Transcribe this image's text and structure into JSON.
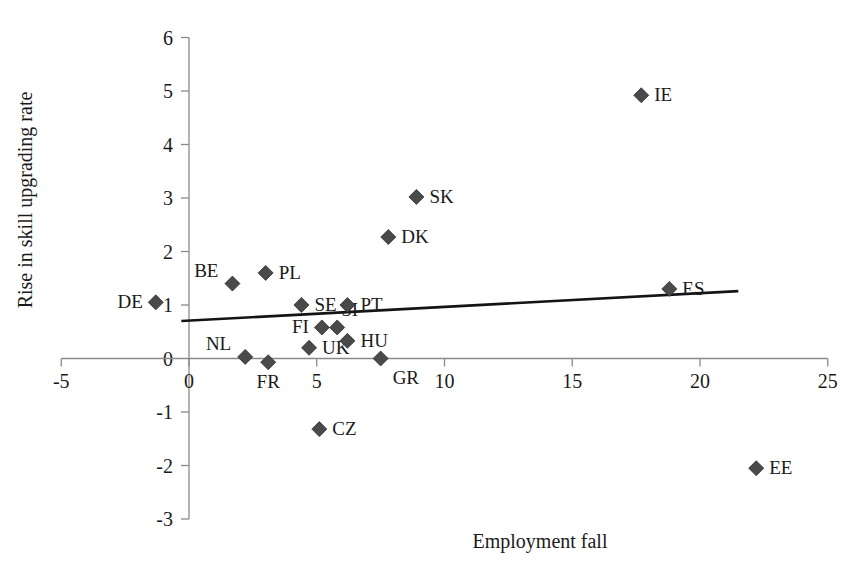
{
  "chart_data": {
    "type": "scatter",
    "title": "",
    "xlabel": "Employment fall",
    "ylabel": "Rise in skill upgrading rate",
    "xlim": [
      -5,
      25
    ],
    "ylim": [
      -3,
      6
    ],
    "xticks": [
      -5,
      0,
      5,
      10,
      15,
      20,
      25
    ],
    "yticks": [
      -3,
      -2,
      -1,
      0,
      1,
      2,
      3,
      4,
      5,
      6
    ],
    "xtick_labels": [
      "-5",
      "0",
      "5",
      "10",
      "15",
      "20",
      "25"
    ],
    "ytick_labels": [
      "-3",
      "-2",
      "-1",
      "0",
      "1",
      "2",
      "3",
      "4",
      "5",
      "6"
    ],
    "grid": false,
    "legend": "none",
    "marker_shape": "diamond",
    "marker_color": "#4a4a4a",
    "points": [
      {
        "label": "DE",
        "x": -1.3,
        "y": 1.05,
        "label_side": "left"
      },
      {
        "label": "BE",
        "x": 1.7,
        "y": 1.4,
        "label_side": "upleft"
      },
      {
        "label": "NL",
        "x": 2.2,
        "y": 0.03,
        "label_side": "upleft"
      },
      {
        "label": "PL",
        "x": 3.0,
        "y": 1.6,
        "label_side": "right"
      },
      {
        "label": "FR",
        "x": 3.1,
        "y": -0.07,
        "label_side": "down"
      },
      {
        "label": "SE",
        "x": 4.4,
        "y": 1.0,
        "label_side": "right"
      },
      {
        "label": "UK",
        "x": 4.7,
        "y": 0.2,
        "label_side": "right"
      },
      {
        "label": "FI",
        "x": 5.2,
        "y": 0.58,
        "label_side": "left"
      },
      {
        "label": "CZ",
        "x": 5.1,
        "y": -1.32,
        "label_side": "right"
      },
      {
        "label": "SI",
        "x": 5.8,
        "y": 0.58,
        "label_side": "upright"
      },
      {
        "label": "PT",
        "x": 6.2,
        "y": 1.0,
        "label_side": "right"
      },
      {
        "label": "HU",
        "x": 6.2,
        "y": 0.33,
        "label_side": "right"
      },
      {
        "label": "GR",
        "x": 7.5,
        "y": 0.0,
        "label_side": "downright"
      },
      {
        "label": "DK",
        "x": 7.8,
        "y": 2.27,
        "label_side": "right"
      },
      {
        "label": "SK",
        "x": 8.9,
        "y": 3.02,
        "label_side": "right"
      },
      {
        "label": "IE",
        "x": 17.7,
        "y": 4.92,
        "label_side": "right"
      },
      {
        "label": "ES",
        "x": 18.8,
        "y": 1.3,
        "label_side": "right"
      },
      {
        "label": "EE",
        "x": 22.2,
        "y": -2.05,
        "label_side": "right"
      }
    ],
    "trendline": {
      "x_start": -0.3,
      "y_start": 0.7,
      "x_end": 21.5,
      "y_end": 1.26,
      "color": "#141414"
    }
  }
}
